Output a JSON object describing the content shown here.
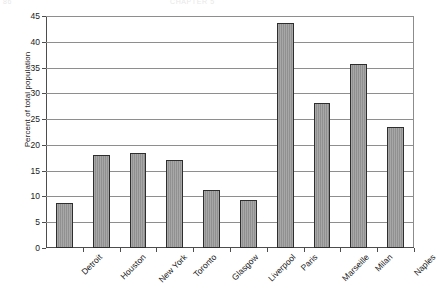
{
  "page_header": {
    "left_text": "86",
    "center_text": "CHAPTER 5"
  },
  "chart_data": {
    "type": "bar",
    "title": "",
    "xlabel": "",
    "ylabel": "Percent of total population",
    "categories": [
      "Detroit",
      "Houston",
      "New York",
      "Toronto",
      "Glasgow",
      "Liverpool",
      "Paris",
      "Marseille",
      "Milan",
      "Naples"
    ],
    "values": [
      8.8,
      18.1,
      18.4,
      17.1,
      11.3,
      9.4,
      43.7,
      28.2,
      35.6,
      23.5
    ],
    "ylim": [
      0,
      45
    ],
    "ytick_values": [
      0,
      5,
      10,
      15,
      20,
      25,
      30,
      35,
      40,
      45
    ],
    "ytick_labels": [
      "0",
      "5",
      "10",
      "15",
      "20",
      "25",
      "30",
      "35",
      "40",
      "45"
    ],
    "grid": true,
    "legend": false,
    "bar_color": "#979797",
    "bar_edge_color": "#2e2e2e",
    "axis_color": "#4d4d4d",
    "grid_color": "#8e8e8e"
  }
}
